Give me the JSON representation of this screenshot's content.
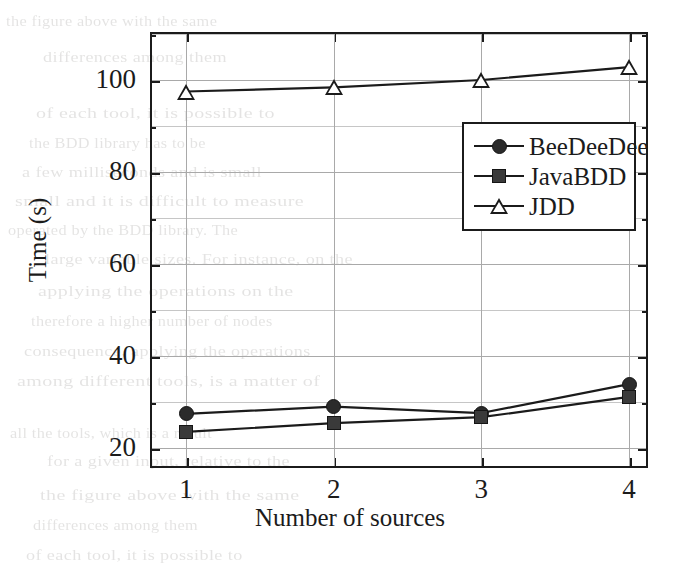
{
  "chart_data": {
    "type": "line",
    "title": "",
    "xlabel": "Number of sources",
    "ylabel": "Time (s)",
    "x": [
      1,
      2,
      3,
      4
    ],
    "xticklabels": [
      "1",
      "2",
      "3",
      "4"
    ],
    "yticklabels": [
      "20",
      "40",
      "60",
      "80",
      "100"
    ],
    "yticks": [
      20,
      40,
      60,
      80,
      100
    ],
    "yminorticks": [
      30,
      50,
      70,
      90,
      110
    ],
    "xlim": [
      0.6,
      4.4
    ],
    "ylim": [
      17,
      112
    ],
    "grid": true,
    "legend_position": "center right",
    "series": [
      {
        "name": "BeeDeeDee",
        "marker": "filled-circle",
        "values": [
          27.4,
          29.0,
          27.6,
          33.9
        ]
      },
      {
        "name": "JavaBDD",
        "marker": "filled-square",
        "values": [
          23.5,
          25.4,
          26.7,
          31.1
        ]
      },
      {
        "name": "JDD",
        "marker": "open-triangle",
        "values": [
          97.5,
          98.4,
          100.0,
          102.8
        ]
      }
    ]
  },
  "legend": {
    "entries": [
      {
        "label": "BeeDeeDee",
        "marker": "filled-circle"
      },
      {
        "label": "JavaBDD",
        "marker": "filled-square"
      },
      {
        "label": "JDD",
        "marker": "open-triangle"
      }
    ]
  },
  "axes": {
    "x_title": "Number of sources",
    "y_title": "Time (s)",
    "x_ticks": [
      "1",
      "2",
      "3",
      "4"
    ],
    "y_ticks": [
      "100",
      "80",
      "60",
      "40",
      "20"
    ]
  },
  "colors": {
    "line": "#1b1b1b",
    "grid": "#a9a9a9",
    "frame": "#1b1b1b",
    "background": "#ffffff",
    "marker_fill": "#2b2b2b"
  },
  "background_bleed": {
    "lines": [
      "the figure above with the same",
      "differences among them",
      "of each tool, it is possible to",
      "the BDD library has to be",
      "a few milliseconds and is small",
      "small and it is difficult to measure",
      "operated by the BDD library. The",
      "large variable sizes. For instance, on the",
      "applying  the  operations  on  the",
      "therefore  a  higher  number  of  nodes",
      "consequence, applying the operations",
      "among different tools, is a matter of",
      "all  the  tools,  which  is  a  result",
      "for  a  given  input,  relative  to  the"
    ]
  }
}
